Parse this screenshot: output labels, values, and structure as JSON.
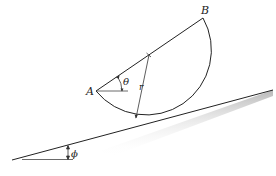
{
  "figure": {
    "type": "semicircular body resting on incline",
    "labels": {
      "point_a": "A",
      "point_b": "B",
      "radius": "r",
      "angle_theta": "θ",
      "angle_phi": "ϕ"
    },
    "colors": {
      "line": "#222222",
      "fill": "#ffffff",
      "shadow": "#bbbbbb"
    }
  }
}
